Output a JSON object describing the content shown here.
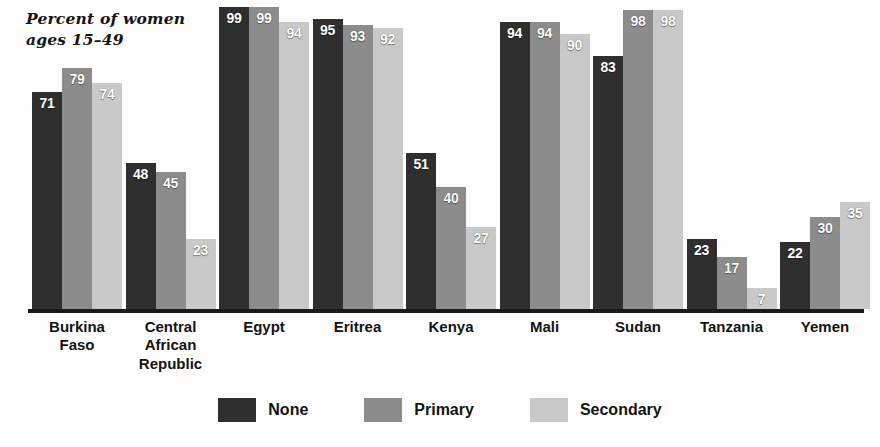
{
  "chart_data": {
    "type": "bar",
    "title": "",
    "subtitle": "",
    "axis_note": "Percent of women\nages 15–49",
    "xlabel": "",
    "ylabel": "Percent of women ages 15-49",
    "ylim": [
      0,
      100
    ],
    "grid": false,
    "legend_position": "bottom",
    "categories": [
      "Burkina\nFaso",
      "Central\nAfrican\nRepublic",
      "Egypt",
      "Eritrea",
      "Kenya",
      "Mali",
      "Sudan",
      "Tanzania",
      "Yemen"
    ],
    "series": [
      {
        "name": "None",
        "color": "#2f2f2f",
        "values": [
          71,
          48,
          99,
          95,
          51,
          94,
          83,
          23,
          22
        ]
      },
      {
        "name": "Primary",
        "color": "#8c8c8c",
        "values": [
          79,
          45,
          99,
          93,
          40,
          94,
          98,
          17,
          30
        ]
      },
      {
        "name": "Secondary",
        "color": "#c9c9c9",
        "values": [
          74,
          23,
          94,
          92,
          27,
          90,
          98,
          7,
          35
        ]
      }
    ]
  },
  "legend": {
    "items": [
      {
        "label": "None"
      },
      {
        "label": "Primary"
      },
      {
        "label": "Secondary"
      }
    ]
  },
  "colors": {
    "none": "#2f2f2f",
    "primary": "#8c8c8c",
    "secondary": "#c9c9c9",
    "baseline": "#1a1a1a",
    "text": "#141414",
    "background": "#fdfdfd",
    "value_label": "#ffffff"
  }
}
